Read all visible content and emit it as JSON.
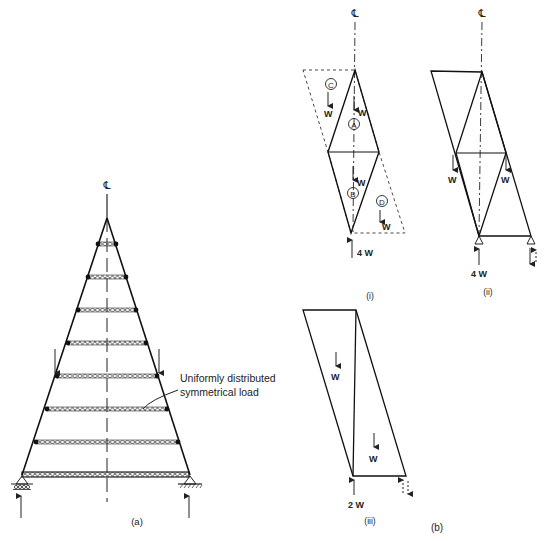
{
  "figure": {
    "panel_a": {
      "caption": "(a)",
      "centerline_label": "℄",
      "load_annotation_line1": "Uniformly distributed",
      "load_annotation_line2": "symmetrical load",
      "chord_count": 8,
      "supports": [
        "roller",
        "pinned"
      ]
    },
    "panel_b": {
      "caption": "(b)",
      "sub_i": {
        "caption": "(i)",
        "centerline_label": "℄",
        "regions": [
          "C",
          "A",
          "B",
          "D"
        ],
        "loads": [
          "W",
          "W",
          "W",
          "W"
        ],
        "reaction": "4 W"
      },
      "sub_ii": {
        "caption": "(ii)",
        "centerline_label": "℄",
        "loads": [
          "W",
          "W"
        ],
        "reaction": "4 W"
      },
      "sub_iii": {
        "caption": "(iii)",
        "loads": [
          "W",
          "W"
        ],
        "reaction": "2 W"
      }
    }
  }
}
